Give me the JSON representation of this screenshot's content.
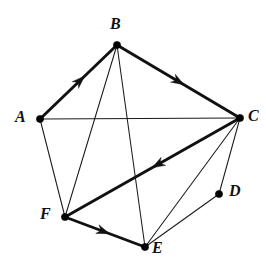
{
  "figure": {
    "background_color": "#ffffff",
    "stroke_color": "#111111",
    "width": 266,
    "height": 260
  },
  "vertices": [
    {
      "id": "A",
      "label": "A",
      "x": 40,
      "y": 119,
      "label_x": 15,
      "label_y": 109
    },
    {
      "id": "B",
      "label": "B",
      "x": 117,
      "y": 45,
      "label_x": 110,
      "label_y": 16
    },
    {
      "id": "C",
      "label": "C",
      "x": 240,
      "y": 118,
      "label_x": 248,
      "label_y": 108
    },
    {
      "id": "D",
      "label": "D",
      "x": 219,
      "y": 194,
      "label_x": 229,
      "label_y": 183
    },
    {
      "id": "E",
      "label": "E",
      "x": 145,
      "y": 247,
      "label_x": 152,
      "label_y": 240
    },
    {
      "id": "F",
      "label": "F",
      "x": 65,
      "y": 217,
      "label_x": 40,
      "label_y": 206
    }
  ],
  "edges": [
    {
      "from": "A",
      "to": "B",
      "style": "thick",
      "directed": true,
      "arrow_at": 0.52
    },
    {
      "from": "B",
      "to": "C",
      "style": "thick",
      "directed": true,
      "arrow_at": 0.5
    },
    {
      "from": "C",
      "to": "F",
      "style": "thick",
      "directed": true,
      "arrow_at": 0.47
    },
    {
      "from": "F",
      "to": "E",
      "style": "thick",
      "directed": true,
      "arrow_at": 0.48
    },
    {
      "from": "A",
      "to": "C",
      "style": "thin",
      "directed": false,
      "arrow_at": 0
    },
    {
      "from": "A",
      "to": "F",
      "style": "thin",
      "directed": false,
      "arrow_at": 0
    },
    {
      "from": "B",
      "to": "F",
      "style": "thin",
      "directed": false,
      "arrow_at": 0
    },
    {
      "from": "B",
      "to": "E",
      "style": "thin",
      "directed": false,
      "arrow_at": 0
    },
    {
      "from": "C",
      "to": "E",
      "style": "thin",
      "directed": false,
      "arrow_at": 0
    },
    {
      "from": "C",
      "to": "D",
      "style": "thin",
      "directed": false,
      "arrow_at": 0
    },
    {
      "from": "D",
      "to": "E",
      "style": "thin",
      "directed": false,
      "arrow_at": 0
    }
  ]
}
